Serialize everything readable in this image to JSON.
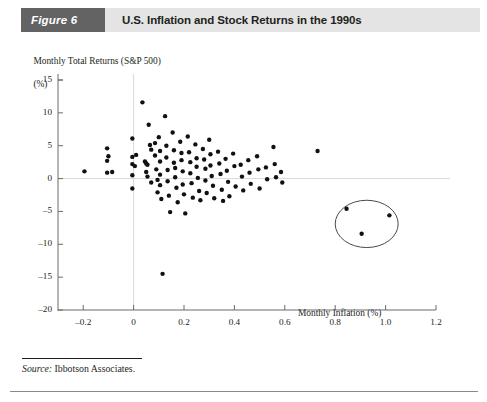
{
  "header": {
    "figure_tag": "Figure 6",
    "title": "U.S. Inflation and Stock Returns in the 1990s",
    "tag_bg": "#636363",
    "band_bg": "#e4e4e4"
  },
  "source": {
    "label": "Source:",
    "text": " Ibbotson Associates."
  },
  "chart_data": {
    "type": "scatter",
    "title": "U.S. Inflation and Stock Returns in the 1990s",
    "xlabel": "Monthly Inflation (%)",
    "ylabel": "Monthly Total Returns (S&P 500)\n(%)",
    "ylabel_line1": "Monthly Total Returns (S&P 500)",
    "ylabel_line2": "(%)",
    "xlim": [
      -0.3,
      1.2
    ],
    "ylim": [
      -20,
      15
    ],
    "xticks": [
      -0.2,
      0,
      0.2,
      0.4,
      0.6,
      0.8,
      1.0,
      1.2
    ],
    "xtick_labels": [
      "–0.2",
      "0",
      "0.2",
      "0.4",
      "0.6",
      "0.8",
      "1.0",
      "1.2"
    ],
    "yticks": [
      15,
      10,
      5,
      0,
      -5,
      -10,
      -15,
      -20
    ],
    "ytick_labels": [
      "15",
      "10",
      "5",
      "0",
      "–5",
      "–10",
      "–15",
      "–20"
    ],
    "grid": "zero-lines-only",
    "gridlines": {
      "vertical_at_x": 0,
      "horizontal_at_y": 0,
      "color": "#d9d9d9"
    },
    "legend": "none",
    "marker": {
      "shape": "circle",
      "color": "#111111",
      "size_px": 4.4
    },
    "annotations": [
      {
        "type": "ellipse",
        "name": "outlier-highlight-ellipse",
        "center_x": 0.925,
        "center_y": -6.9,
        "radius_x": 0.125,
        "radius_y": 3.6,
        "stroke": "#4a4a4a"
      }
    ],
    "points": [
      [
        -0.195,
        1.1
      ],
      [
        -0.105,
        4.6
      ],
      [
        -0.105,
        2.7
      ],
      [
        -0.105,
        0.9
      ],
      [
        -0.1,
        3.4
      ],
      [
        -0.085,
        1.0
      ],
      [
        -0.005,
        6.1
      ],
      [
        -0.005,
        3.3
      ],
      [
        -0.005,
        2.2
      ],
      [
        -0.005,
        0.5
      ],
      [
        -0.005,
        -1.5
      ],
      [
        0.005,
        1.9
      ],
      [
        0.01,
        3.6
      ],
      [
        0.035,
        11.6
      ],
      [
        0.045,
        2.6
      ],
      [
        0.05,
        2.3
      ],
      [
        0.055,
        2.1
      ],
      [
        0.05,
        1.0
      ],
      [
        0.055,
        0.3
      ],
      [
        0.06,
        8.2
      ],
      [
        0.065,
        5.1
      ],
      [
        0.07,
        4.4
      ],
      [
        0.07,
        -0.6
      ],
      [
        0.085,
        5.4
      ],
      [
        0.085,
        3.5
      ],
      [
        0.09,
        1.4
      ],
      [
        0.095,
        -0.2
      ],
      [
        0.095,
        -2.1
      ],
      [
        0.1,
        6.3
      ],
      [
        0.105,
        4.2
      ],
      [
        0.105,
        2.6
      ],
      [
        0.105,
        0.6
      ],
      [
        0.105,
        -1.0
      ],
      [
        0.11,
        -3.1
      ],
      [
        0.115,
        -14.5
      ],
      [
        0.125,
        9.5
      ],
      [
        0.13,
        5.0
      ],
      [
        0.13,
        3.2
      ],
      [
        0.135,
        1.3
      ],
      [
        0.135,
        -0.4
      ],
      [
        0.14,
        -2.6
      ],
      [
        0.145,
        -5.1
      ],
      [
        0.155,
        7.0
      ],
      [
        0.16,
        4.3
      ],
      [
        0.16,
        2.4
      ],
      [
        0.165,
        1.6
      ],
      [
        0.165,
        0.2
      ],
      [
        0.17,
        -1.4
      ],
      [
        0.175,
        -3.6
      ],
      [
        0.185,
        5.6
      ],
      [
        0.19,
        3.9
      ],
      [
        0.19,
        2.8
      ],
      [
        0.195,
        1.1
      ],
      [
        0.195,
        -0.9
      ],
      [
        0.2,
        -2.4
      ],
      [
        0.205,
        -5.3
      ],
      [
        0.215,
        6.4
      ],
      [
        0.22,
        4.0
      ],
      [
        0.225,
        2.5
      ],
      [
        0.225,
        0.8
      ],
      [
        0.23,
        -0.7
      ],
      [
        0.235,
        -2.9
      ],
      [
        0.245,
        5.2
      ],
      [
        0.25,
        3.1
      ],
      [
        0.25,
        1.8
      ],
      [
        0.255,
        0.1
      ],
      [
        0.26,
        -1.9
      ],
      [
        0.265,
        -3.3
      ],
      [
        0.275,
        4.5
      ],
      [
        0.28,
        2.9
      ],
      [
        0.285,
        1.5
      ],
      [
        0.285,
        -0.3
      ],
      [
        0.29,
        -2.2
      ],
      [
        0.3,
        5.9
      ],
      [
        0.305,
        3.7
      ],
      [
        0.305,
        2.0
      ],
      [
        0.31,
        0.4
      ],
      [
        0.315,
        -1.1
      ],
      [
        0.32,
        -3.0
      ],
      [
        0.335,
        4.1
      ],
      [
        0.34,
        2.3
      ],
      [
        0.345,
        0.7
      ],
      [
        0.35,
        -1.7
      ],
      [
        0.355,
        -3.4
      ],
      [
        0.365,
        3.0
      ],
      [
        0.37,
        1.2
      ],
      [
        0.375,
        -0.5
      ],
      [
        0.38,
        -2.7
      ],
      [
        0.395,
        3.8
      ],
      [
        0.4,
        1.9
      ],
      [
        0.405,
        -1.2
      ],
      [
        0.425,
        2.1
      ],
      [
        0.43,
        0.3
      ],
      [
        0.435,
        -1.8
      ],
      [
        0.455,
        2.8
      ],
      [
        0.46,
        0.9
      ],
      [
        0.465,
        -0.8
      ],
      [
        0.49,
        3.4
      ],
      [
        0.495,
        1.4
      ],
      [
        0.5,
        -1.5
      ],
      [
        0.525,
        1.7
      ],
      [
        0.53,
        -0.1
      ],
      [
        0.555,
        4.8
      ],
      [
        0.56,
        2.2
      ],
      [
        0.565,
        0.2
      ],
      [
        0.585,
        1.0
      ],
      [
        0.59,
        -0.6
      ],
      [
        0.73,
        4.2
      ],
      [
        0.845,
        -4.6
      ],
      [
        0.905,
        -8.4
      ],
      [
        1.015,
        -5.6
      ]
    ],
    "highlighted_points": [
      [
        0.845,
        -4.6
      ],
      [
        0.905,
        -8.4
      ],
      [
        1.015,
        -5.6
      ]
    ],
    "n_points": 112
  }
}
